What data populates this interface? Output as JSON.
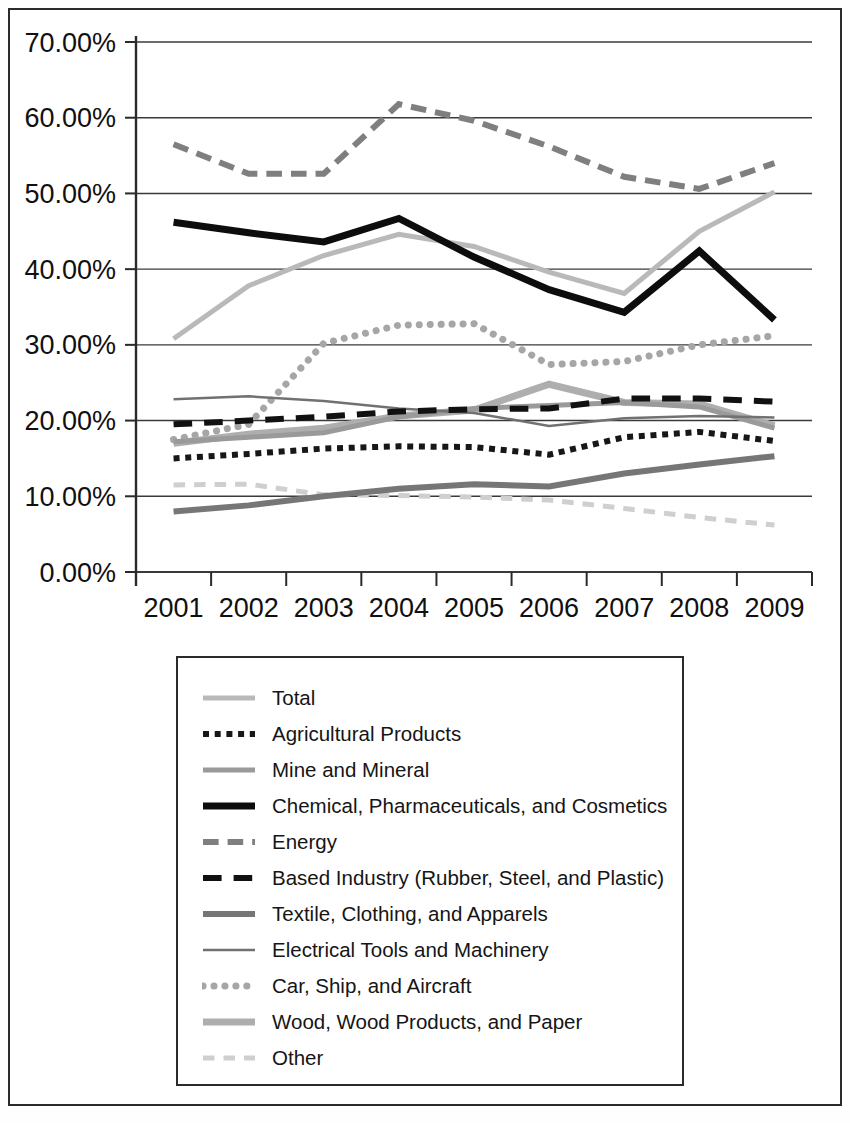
{
  "chart_data": {
    "type": "line",
    "title": "",
    "xlabel": "",
    "ylabel": "",
    "x": [
      "2001",
      "2002",
      "2003",
      "2004",
      "2005",
      "2006",
      "2007",
      "2008",
      "2009"
    ],
    "ylim": [
      0,
      70
    ],
    "y_ticks": [
      "0.00%",
      "10.00%",
      "20.00%",
      "30.00%",
      "40.00%",
      "50.00%",
      "60.00%",
      "70.00%"
    ],
    "y_tick_values": [
      0,
      10,
      20,
      30,
      40,
      50,
      60,
      70
    ],
    "grid": true,
    "legend_position": "bottom",
    "series": [
      {
        "name": "Total",
        "style": "solid-light",
        "color": "#b9b9b9",
        "width": 5,
        "values": [
          30.8,
          37.8,
          41.8,
          44.6,
          43.0,
          39.6,
          36.8,
          45.0,
          50.2
        ]
      },
      {
        "name": "Agricultural Products",
        "style": "dotted-thick-black",
        "color": "#171717",
        "width": 6,
        "values": [
          15.0,
          15.6,
          16.3,
          16.6,
          16.5,
          15.5,
          17.8,
          18.5,
          17.3
        ]
      },
      {
        "name": "Mine and Mineral",
        "style": "solid-medium-gray",
        "color": "#9a9a9a",
        "width": 5,
        "values": [
          17.2,
          17.8,
          18.4,
          20.5,
          21.6,
          22.0,
          22.4,
          21.8,
          19.0
        ]
      },
      {
        "name": "Chemical, Pharmaceuticals, and Cosmetics",
        "style": "solid-heavy-black",
        "color": "#0d0d0d",
        "width": 7,
        "values": [
          46.2,
          44.8,
          43.6,
          46.7,
          41.6,
          37.3,
          34.3,
          42.4,
          33.3
        ]
      },
      {
        "name": "Energy",
        "style": "dash-dot-gray",
        "color": "#7f7f7f",
        "width": 6,
        "values": [
          56.5,
          52.6,
          52.6,
          61.8,
          59.6,
          56.2,
          52.2,
          50.6,
          54.0
        ]
      },
      {
        "name": "Based Industry (Rubber, Steel, and Plastic)",
        "style": "dashed-black",
        "color": "#111111",
        "width": 6,
        "values": [
          19.5,
          20.0,
          20.5,
          21.2,
          21.5,
          21.6,
          22.9,
          22.9,
          22.5
        ]
      },
      {
        "name": "Textile, Clothing, and Apparels",
        "style": "solid-dark-gray",
        "color": "#767676",
        "width": 6,
        "values": [
          8.0,
          8.8,
          10.0,
          11.0,
          11.6,
          11.3,
          13.0,
          14.2,
          15.3
        ]
      },
      {
        "name": "Electrical Tools and Machinery",
        "style": "solid-thin-gray",
        "color": "#717171",
        "width": 2.5,
        "values": [
          22.8,
          23.2,
          22.6,
          21.6,
          21.0,
          19.3,
          20.3,
          20.6,
          20.4
        ]
      },
      {
        "name": "Car, Ship, and Aircraft",
        "style": "dotted-round-gray",
        "color": "#a6a6a6",
        "width": 7,
        "values": [
          17.5,
          19.5,
          30.2,
          32.6,
          32.8,
          27.4,
          27.8,
          30.0,
          31.2
        ]
      },
      {
        "name": "Wood, Wood Products, and Paper",
        "style": "solid-thick-lightgray",
        "color": "#aeaeae",
        "width": 7,
        "values": [
          17.0,
          18.2,
          19.0,
          20.6,
          21.4,
          24.8,
          22.4,
          22.2,
          19.3
        ]
      },
      {
        "name": "Other",
        "style": "dashed-verylight",
        "color": "#cfcfcf",
        "width": 5,
        "values": [
          11.5,
          11.6,
          10.2,
          10.1,
          9.9,
          9.5,
          8.4,
          7.2,
          6.2
        ]
      }
    ]
  },
  "legend": {
    "items": [
      {
        "label": "Total",
        "swatch": "solid-light"
      },
      {
        "label": "Agricultural Products",
        "swatch": "dotted-thick-black"
      },
      {
        "label": "Mine and Mineral",
        "swatch": "solid-medium-gray"
      },
      {
        "label": "Chemical, Pharmaceuticals, and Cosmetics",
        "swatch": "solid-heavy-black"
      },
      {
        "label": "Energy",
        "swatch": "dash-dot-gray"
      },
      {
        "label": "Based Industry (Rubber, Steel, and Plastic)",
        "swatch": "dashed-black"
      },
      {
        "label": "Textile, Clothing, and Apparels",
        "swatch": "solid-dark-gray"
      },
      {
        "label": "Electrical Tools and Machinery",
        "swatch": "solid-thin-gray"
      },
      {
        "label": "Car, Ship, and Aircraft",
        "swatch": "dotted-round-gray"
      },
      {
        "label": "Wood, Wood Products, and Paper",
        "swatch": "solid-thick-lightgray"
      },
      {
        "label": "Other",
        "swatch": "dashed-verylight"
      }
    ]
  }
}
